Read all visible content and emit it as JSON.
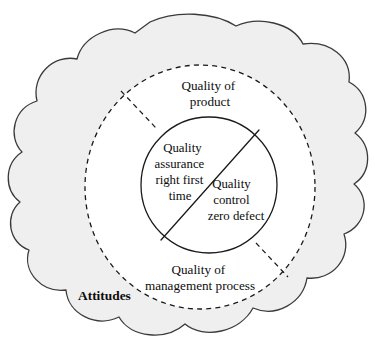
{
  "diagram": {
    "title_label": "Attitudes",
    "outer_region": {
      "name": "attitudes-cloud",
      "label": "Attitudes",
      "fill_color": "#efefef",
      "stroke_color": "#3a3a3a"
    },
    "middle_region": {
      "name": "quality-ring",
      "fill_color": "#ffffff",
      "stroke_color": "#1a1a1a",
      "stroke_style": "dashed",
      "top_label_line1": "Quality of",
      "top_label_line2": "product",
      "bottom_label_line1": "Quality of",
      "bottom_label_line2": "management process"
    },
    "inner_region": {
      "name": "quality-core-circle",
      "fill_color": "#ffffff",
      "stroke_color": "#1a1a1a",
      "upper_left": {
        "line1": "Quality",
        "line2": "assurance",
        "line3": "right first",
        "line4": "time"
      },
      "lower_right": {
        "line1": "Quality",
        "line2": "control",
        "line3": "zero defect"
      }
    }
  }
}
